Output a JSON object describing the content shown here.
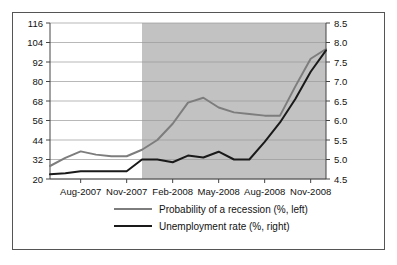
{
  "chart_data": {
    "type": "line",
    "title": "",
    "xlabel": "",
    "grid": true,
    "legend_position": "bottom",
    "shaded_region": {
      "label": "recession-shading",
      "start": "Dec-2007",
      "end": "Dec-2008",
      "color": "#c2c2c2"
    },
    "x": [
      "Jun-2007",
      "Jul-2007",
      "Aug-2007",
      "Sep-2007",
      "Oct-2007",
      "Nov-2007",
      "Dec-2007",
      "Jan-2008",
      "Feb-2008",
      "Mar-2008",
      "Apr-2008",
      "May-2008",
      "Jun-2008",
      "Jul-2008",
      "Aug-2008",
      "Sep-2008",
      "Oct-2008",
      "Nov-2008",
      "Dec-2008"
    ],
    "xticks": [
      "Aug-2007",
      "Nov-2007",
      "Feb-2008",
      "May-2008",
      "Aug-2008",
      "Nov-2008"
    ],
    "axes": [
      {
        "name": "left",
        "label": "Probability of a recession (%)",
        "ylim": [
          20,
          116
        ],
        "ticks": [
          20,
          32,
          44,
          56,
          68,
          80,
          92,
          104,
          116
        ]
      },
      {
        "name": "right",
        "label": "Unemployment rate (%)",
        "ylim": [
          4.5,
          8.5
        ],
        "ticks": [
          4.5,
          5.0,
          5.5,
          6.0,
          6.5,
          7.0,
          7.5,
          8.0,
          8.5
        ]
      }
    ],
    "series": [
      {
        "name": "Probability of a recession (%, left)",
        "axis": "left",
        "color": "#7d7d7d",
        "width": 2.0,
        "values": [
          28,
          33,
          37,
          35,
          34,
          34,
          38,
          44,
          54,
          67,
          70,
          64,
          61,
          60,
          59,
          59,
          77,
          94,
          100
        ]
      },
      {
        "name": "Unemployment rate (%, right)",
        "axis": "right",
        "color": "#1a1a1a",
        "width": 2.0,
        "values": [
          4.62,
          4.65,
          4.7,
          4.7,
          4.7,
          4.7,
          5.0,
          5.0,
          4.93,
          5.1,
          5.05,
          5.2,
          5.0,
          5.0,
          5.45,
          5.95,
          6.55,
          7.25,
          7.8
        ]
      }
    ],
    "legend": [
      {
        "label": "Probability of a recession (%, left)",
        "color": "#7d7d7d"
      },
      {
        "label": "Unemployment rate (%, right)",
        "color": "#1a1a1a"
      }
    ]
  }
}
